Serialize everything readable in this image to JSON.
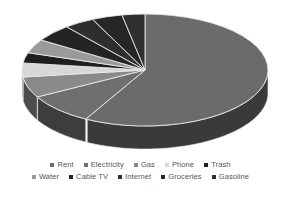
{
  "chart_data": {
    "type": "pie",
    "title": "",
    "subtitle": "",
    "xlabel": "",
    "ylabel": "",
    "legend_position": "bottom",
    "grid": false,
    "three_d": true,
    "start_angle_deg": 0,
    "direction": "clockwise",
    "categories": [
      "Rent",
      "Electricity",
      "Gas",
      "Phone",
      "Trash",
      "Water",
      "Cable TV",
      "Internet",
      "Groceries",
      "Gasoline"
    ],
    "values": [
      58,
      9,
      6,
      4,
      3,
      4,
      5,
      4,
      4,
      3
    ],
    "units": "percent",
    "slices": [
      {
        "label": "Rent",
        "value": 58,
        "color": "#6b6b6b",
        "side_color": "#3a3a3a"
      },
      {
        "label": "Electricity",
        "value": 9,
        "color": "#6f6f6f",
        "side_color": "#3d3d3d"
      },
      {
        "label": "Gas",
        "value": 6,
        "color": "#8a8a8a",
        "side_color": "#4c4c4c"
      },
      {
        "label": "Phone",
        "value": 4,
        "color": "#d8d8d8",
        "side_color": "#8f8f8f"
      },
      {
        "label": "Trash",
        "value": 3,
        "color": "#1f1f1f",
        "side_color": "#141414"
      },
      {
        "label": "Water",
        "value": 4,
        "color": "#9a9a9a",
        "side_color": "#555555"
      },
      {
        "label": "Cable TV",
        "value": 5,
        "color": "#242424",
        "side_color": "#161616"
      },
      {
        "label": "Internet",
        "value": 4,
        "color": "#2e2e2e",
        "side_color": "#1c1c1c"
      },
      {
        "label": "Groceries",
        "value": 4,
        "color": "#262626",
        "side_color": "#171717"
      },
      {
        "label": "Gasoline",
        "value": 3,
        "color": "#303030",
        "side_color": "#1d1d1d"
      }
    ]
  },
  "legend": {
    "rows": [
      [
        {
          "label": "Rent",
          "color": "#6b6b6b"
        },
        {
          "label": "Electricity",
          "color": "#6f6f6f"
        },
        {
          "label": "Gas",
          "color": "#8a8a8a"
        },
        {
          "label": "Phone",
          "color": "#d8d8d8"
        },
        {
          "label": "Trash",
          "color": "#1f1f1f"
        }
      ],
      [
        {
          "label": "Water",
          "color": "#9a9a9a"
        },
        {
          "label": "Cable TV",
          "color": "#242424"
        },
        {
          "label": "Internet",
          "color": "#2e2e2e"
        },
        {
          "label": "Groceries",
          "color": "#262626"
        },
        {
          "label": "Gasoline",
          "color": "#303030"
        }
      ]
    ]
  },
  "geometry": {
    "cx": 145,
    "cy": 70,
    "rx": 123,
    "ry": 56,
    "depth": 23,
    "separator_color": "#e8e8e8"
  }
}
